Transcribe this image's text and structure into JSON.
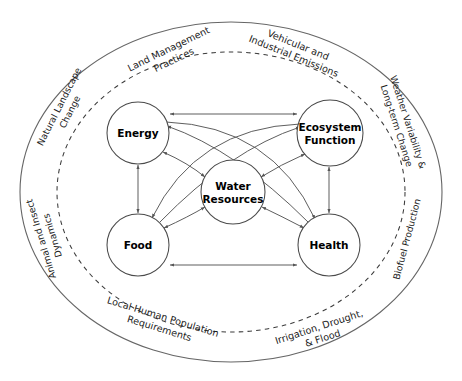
{
  "diagram": {
    "colors": {
      "outer_ellipse_stroke": "#666666",
      "dashed_ellipse_stroke": "#3a3a3a",
      "node_stroke": "#4a4a4a",
      "node_fill": "#ffffff",
      "arrow_stroke": "#555555",
      "text": "#1b1b1b",
      "background": "#ffffff"
    },
    "nodes": [
      {
        "id": "energy",
        "label": "Energy",
        "line1": "Energy",
        "line2": "",
        "cx": 138,
        "cy": 133,
        "r": 31
      },
      {
        "id": "ecosystem",
        "label": "Ecosystem Function",
        "line1": "Ecosystem",
        "line2": "Function",
        "cx": 330,
        "cy": 133,
        "r": 33
      },
      {
        "id": "water",
        "label": "Water Resources",
        "line1": "Water",
        "line2": "Resources",
        "cx": 233,
        "cy": 192,
        "r": 32
      },
      {
        "id": "food",
        "label": "Food",
        "line1": "Food",
        "line2": "",
        "cx": 138,
        "cy": 245,
        "r": 31
      },
      {
        "id": "health",
        "label": "Health",
        "line1": "Health",
        "line2": "",
        "cx": 329,
        "cy": 245,
        "r": 31
      }
    ],
    "edges": [
      {
        "from": "energy",
        "to": "ecosystem",
        "kind": "straight",
        "arrows": "both",
        "name": "energy-ecosystem-link"
      },
      {
        "from": "food",
        "to": "health",
        "kind": "straight",
        "arrows": "both",
        "name": "food-health-link"
      },
      {
        "from": "energy",
        "to": "food",
        "kind": "straight",
        "arrows": "both",
        "name": "energy-food-link"
      },
      {
        "from": "ecosystem",
        "to": "health",
        "kind": "straight",
        "arrows": "both",
        "name": "ecosystem-health-link"
      },
      {
        "from": "energy",
        "to": "water",
        "kind": "curve",
        "arrows": "both",
        "name": "energy-water-link"
      },
      {
        "from": "ecosystem",
        "to": "water",
        "kind": "curve",
        "arrows": "both",
        "name": "ecosystem-water-link"
      },
      {
        "from": "food",
        "to": "water",
        "kind": "curve",
        "arrows": "both",
        "name": "food-water-link"
      },
      {
        "from": "health",
        "to": "water",
        "kind": "curve",
        "arrows": "both",
        "name": "health-water-link"
      },
      {
        "from": "energy",
        "to": "health",
        "kind": "curve",
        "arrows": "forward",
        "name": "energy-health-link"
      },
      {
        "from": "ecosystem",
        "to": "food",
        "kind": "curve",
        "arrows": "forward",
        "name": "ecosystem-food-link"
      }
    ],
    "ring_labels": [
      {
        "id": "land-management",
        "line1": "Land Management",
        "line2": "Practices"
      },
      {
        "id": "vehicular",
        "line1": "Vehicular and",
        "line2": "Industrial Emissions"
      },
      {
        "id": "weather",
        "line1": "Weather Variability &",
        "line2": "Long-term Change"
      },
      {
        "id": "biofuel",
        "line1": "Biofuel Production",
        "line2": ""
      },
      {
        "id": "irrigation",
        "line1": "Irrigation, Drought,",
        "line2": "& Flood"
      },
      {
        "id": "local-population",
        "line1": "Local Human Population",
        "line2": "Requirements"
      },
      {
        "id": "animal-insect",
        "line1": "Animal and Insect",
        "line2": "Dynamics"
      },
      {
        "id": "natural-landscape",
        "line1": "Natural Landscape",
        "line2": "Change"
      }
    ]
  }
}
